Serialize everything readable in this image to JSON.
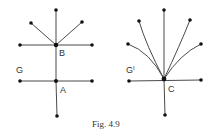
{
  "caption": "Fig. 4.9",
  "colors": {
    "edge": "#4a4a4a",
    "vertex": "#111111",
    "text": "#333333"
  },
  "graphs": [
    {
      "name": "G",
      "label": "G",
      "vertex_labels": {
        "B": "B",
        "A": "A"
      },
      "vertices": [
        {
          "id": "top",
          "x": 56,
          "y": 10
        },
        {
          "id": "ul",
          "x": 31,
          "y": 23
        },
        {
          "id": "ur",
          "x": 82,
          "y": 22
        },
        {
          "id": "B",
          "x": 56,
          "y": 45
        },
        {
          "id": "bl",
          "x": 20,
          "y": 45
        },
        {
          "id": "br",
          "x": 92,
          "y": 45
        },
        {
          "id": "A",
          "x": 56,
          "y": 81
        },
        {
          "id": "al",
          "x": 20,
          "y": 81
        },
        {
          "id": "ar",
          "x": 92,
          "y": 81
        },
        {
          "id": "bottom",
          "x": 57,
          "y": 116
        }
      ],
      "edges": [
        [
          "B",
          "top"
        ],
        [
          "B",
          "ul"
        ],
        [
          "B",
          "ur"
        ],
        [
          "B",
          "bl"
        ],
        [
          "B",
          "br"
        ],
        [
          "B",
          "A"
        ],
        [
          "A",
          "al"
        ],
        [
          "A",
          "ar"
        ],
        [
          "A",
          "bottom"
        ]
      ]
    },
    {
      "name": "G-prime",
      "label": "G",
      "label_superscript": "I",
      "vertex_labels": {
        "C": "C"
      },
      "vertices": [
        {
          "id": "top",
          "x": 164,
          "y": 10
        },
        {
          "id": "ul",
          "x": 139,
          "y": 21
        },
        {
          "id": "ur",
          "x": 190,
          "y": 20
        },
        {
          "id": "ml",
          "x": 128,
          "y": 44
        },
        {
          "id": "mr",
          "x": 201,
          "y": 44
        },
        {
          "id": "C",
          "x": 164,
          "y": 79
        },
        {
          "id": "cl",
          "x": 129,
          "y": 81
        },
        {
          "id": "cr",
          "x": 201,
          "y": 80
        },
        {
          "id": "bottom",
          "x": 165,
          "y": 115
        }
      ],
      "edges": [
        [
          "C",
          "top"
        ],
        [
          "C",
          "ul"
        ],
        [
          "C",
          "ur"
        ],
        [
          "C",
          "ml"
        ],
        [
          "C",
          "mr"
        ],
        [
          "C",
          "cl"
        ],
        [
          "C",
          "cr"
        ],
        [
          "C",
          "bottom"
        ]
      ]
    }
  ]
}
